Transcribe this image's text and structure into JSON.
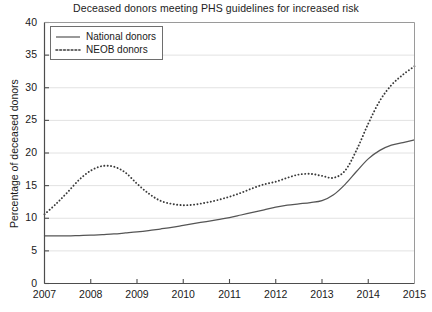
{
  "chart_data": {
    "type": "line",
    "title": "Deceased donors meeting PHS guidelines for increased risk",
    "xlabel": "",
    "ylabel": "Percentage of deceased donors",
    "xlim": [
      2007,
      2015
    ],
    "ylim": [
      0,
      40
    ],
    "grid": true,
    "legend_position": "top-left inside",
    "xticks": [
      "2007",
      "2008",
      "2009",
      "2010",
      "2011",
      "2012",
      "2013",
      "2014",
      "2015"
    ],
    "yticks": [
      "0",
      "5",
      "10",
      "15",
      "20",
      "25",
      "30",
      "35",
      "40"
    ],
    "x": [
      2007,
      2007.25,
      2007.5,
      2007.75,
      2008,
      2008.25,
      2008.5,
      2008.75,
      2009,
      2009.25,
      2009.5,
      2009.75,
      2010,
      2010.25,
      2010.5,
      2010.75,
      2011,
      2011.25,
      2011.5,
      2011.75,
      2012,
      2012.25,
      2012.5,
      2012.75,
      2013,
      2013.25,
      2013.5,
      2013.75,
      2014,
      2014.25,
      2014.5,
      2014.75,
      2015
    ],
    "series": [
      {
        "name": "National donors",
        "style": "solid",
        "color": "#555555",
        "values": [
          7.3,
          7.3,
          7.3,
          7.35,
          7.4,
          7.5,
          7.6,
          7.75,
          7.9,
          8.1,
          8.35,
          8.6,
          8.9,
          9.2,
          9.5,
          9.8,
          10.1,
          10.5,
          10.9,
          11.3,
          11.7,
          12.0,
          12.2,
          12.4,
          12.7,
          13.6,
          15.2,
          17.2,
          19.1,
          20.4,
          21.2,
          21.6,
          22.0
        ]
      },
      {
        "name": "NEOB donors",
        "style": "dotted",
        "color": "#3a3a3a",
        "values": [
          10.6,
          12.2,
          14.0,
          15.9,
          17.3,
          18.0,
          17.9,
          17.0,
          15.3,
          13.8,
          12.7,
          12.2,
          12.0,
          12.1,
          12.4,
          12.8,
          13.3,
          13.9,
          14.6,
          15.2,
          15.6,
          16.2,
          16.7,
          16.8,
          16.5,
          16.2,
          17.3,
          20.5,
          24.5,
          28.0,
          30.4,
          32.0,
          33.3
        ]
      }
    ]
  },
  "legend": {
    "items": [
      {
        "label": "National donors"
      },
      {
        "label": "NEOB donors"
      }
    ]
  }
}
